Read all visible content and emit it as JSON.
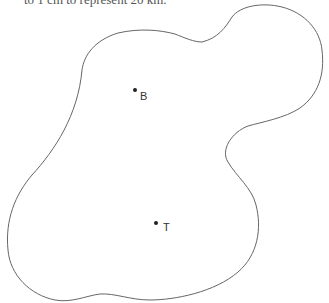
{
  "caption": "to 1 cm to represent 20 km.",
  "points": [
    {
      "id": "B",
      "label": "B",
      "x": 135,
      "y": 90
    },
    {
      "id": "T",
      "label": "T",
      "x": 156,
      "y": 223
    }
  ],
  "outline_color": "#666666"
}
